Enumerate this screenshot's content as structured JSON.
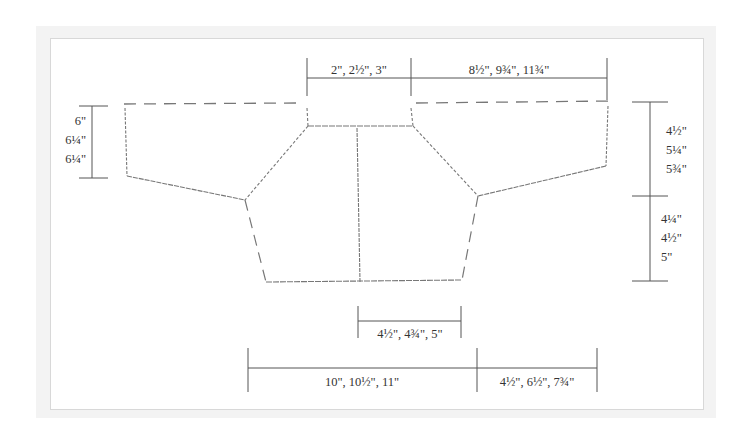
{
  "diagram": {
    "type": "knitting schematic (cardigan/bolero, flat layout)",
    "colors": {
      "frame_background": "#f3f3f3",
      "panel_background": "#ffffff",
      "panel_border": "#d8d8d8",
      "dimension_line": "#555555",
      "outline": "#777777",
      "text": "#333333"
    },
    "measurements": {
      "top_center": "2\", 2½\", 3\"",
      "top_right": "8½\", 9¾\", 11¾\"",
      "left_sleeve_height": [
        "6\"",
        "6¼\"",
        "6¼\""
      ],
      "right_upper_height": [
        "4½\"",
        "5¼\"",
        "5¾\""
      ],
      "right_lower_height": [
        "4¼\"",
        "4½\"",
        "5\""
      ],
      "bottom_center": "4½\", 4¾\", 5\"",
      "bottom_left": "10\", 10½\", 11\"",
      "bottom_right": "4½\", 6½\", 7¾\""
    }
  }
}
